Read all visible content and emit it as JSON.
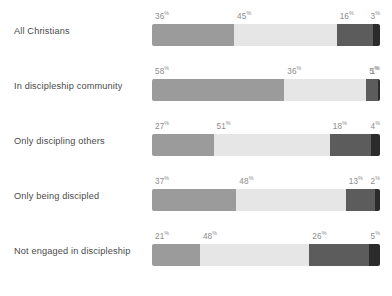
{
  "chart_data": {
    "type": "bar",
    "subtype": "stacked-horizontal-100pct",
    "title": "",
    "xlabel": "",
    "ylabel": "",
    "xlim": [
      0,
      100
    ],
    "grid": false,
    "legend": "none",
    "value_suffix": "%",
    "categories": [
      "All Christians",
      "In discipleship community",
      "Only discipling others",
      "Only being discipled",
      "Not engaged in discipleship"
    ],
    "series": [
      {
        "name": "Segment 1",
        "color": "#9b9b9b",
        "values": [
          36,
          58,
          27,
          37,
          21
        ]
      },
      {
        "name": "Segment 2",
        "color": "#e6e6e6",
        "values": [
          45,
          36,
          51,
          48,
          48
        ]
      },
      {
        "name": "Segment 3",
        "color": "#5c5c5c",
        "values": [
          16,
          5,
          18,
          13,
          26
        ]
      },
      {
        "name": "Segment 4",
        "color": "#2b2b2b",
        "values": [
          3,
          1,
          4,
          2,
          5
        ]
      }
    ],
    "rows": [
      {
        "label": "All Christians",
        "segments": [
          {
            "value": 36,
            "text": "36",
            "suffix": "%",
            "color": "#9b9b9b"
          },
          {
            "value": 45,
            "text": "45",
            "suffix": "%",
            "color": "#e6e6e6"
          },
          {
            "value": 16,
            "text": "16",
            "suffix": "%",
            "color": "#5c5c5c"
          },
          {
            "value": 3,
            "text": "3",
            "suffix": "%",
            "color": "#2b2b2b"
          }
        ]
      },
      {
        "label": "In discipleship community",
        "segments": [
          {
            "value": 58,
            "text": "58",
            "suffix": "%",
            "color": "#9b9b9b"
          },
          {
            "value": 36,
            "text": "36",
            "suffix": "%",
            "color": "#e6e6e6"
          },
          {
            "value": 5,
            "text": "5",
            "suffix": "%",
            "color": "#5c5c5c"
          },
          {
            "value": 1,
            "text": "1",
            "suffix": "%",
            "color": "#2b2b2b"
          }
        ]
      },
      {
        "label": "Only discipling others",
        "segments": [
          {
            "value": 27,
            "text": "27",
            "suffix": "%",
            "color": "#9b9b9b"
          },
          {
            "value": 51,
            "text": "51",
            "suffix": "%",
            "color": "#e6e6e6"
          },
          {
            "value": 18,
            "text": "18",
            "suffix": "%",
            "color": "#5c5c5c"
          },
          {
            "value": 4,
            "text": "4",
            "suffix": "%",
            "color": "#2b2b2b"
          }
        ]
      },
      {
        "label": "Only being discipled",
        "segments": [
          {
            "value": 37,
            "text": "37",
            "suffix": "%",
            "color": "#9b9b9b"
          },
          {
            "value": 48,
            "text": "48",
            "suffix": "%",
            "color": "#e6e6e6"
          },
          {
            "value": 13,
            "text": "13",
            "suffix": "%",
            "color": "#5c5c5c"
          },
          {
            "value": 2,
            "text": "2",
            "suffix": "%",
            "color": "#2b2b2b"
          }
        ]
      },
      {
        "label": "Not engaged in discipleship",
        "segments": [
          {
            "value": 21,
            "text": "21",
            "suffix": "%",
            "color": "#9b9b9b"
          },
          {
            "value": 48,
            "text": "48",
            "suffix": "%",
            "color": "#e6e6e6"
          },
          {
            "value": 26,
            "text": "26",
            "suffix": "%",
            "color": "#5c5c5c"
          },
          {
            "value": 5,
            "text": "5",
            "suffix": "%",
            "color": "#2b2b2b"
          }
        ]
      }
    ]
  },
  "layout": {
    "background": "#ffffff",
    "label_color": "#4a4a4a",
    "value_label_color": "#8c8c8c",
    "bar_left": 152,
    "bar_width": 228,
    "bar_height": 22,
    "row_spacing": 55,
    "first_row_top": 8
  }
}
